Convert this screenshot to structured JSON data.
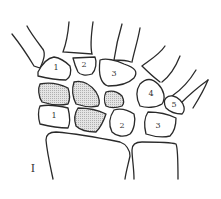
{
  "figure": {
    "label": "I",
    "stroke_color": "#2a2a2a",
    "shade_color": "#c8c8c8"
  },
  "bones": {
    "proximal_row": [
      {
        "label": "1",
        "shaded": false
      },
      {
        "label": "2",
        "shaded": false
      },
      {
        "label": "3",
        "shaded": false
      },
      {
        "label": "4",
        "shaded": false
      },
      {
        "label": "5",
        "shaded": false
      }
    ],
    "middle_row": [
      {
        "label": "",
        "shaded": true
      },
      {
        "label": "",
        "shaded": true
      },
      {
        "label": "",
        "shaded": true
      }
    ],
    "distal_row": [
      {
        "label": "1",
        "shaded": false
      },
      {
        "label": "",
        "shaded": true
      },
      {
        "label": "2",
        "shaded": false
      },
      {
        "label": "3",
        "shaded": false
      }
    ]
  }
}
